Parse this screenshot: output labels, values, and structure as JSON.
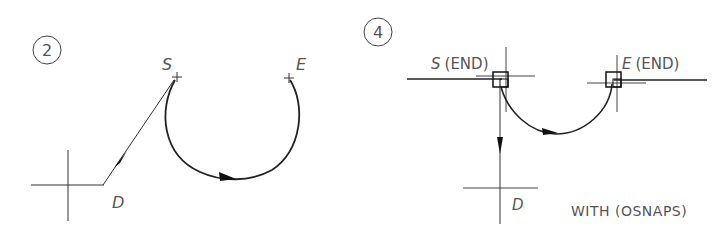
{
  "colors": {
    "background": "#ffffff",
    "line": "#222222",
    "thin_line": "#444444",
    "text": "#555555"
  },
  "panels": [
    {
      "id": "panel-2",
      "step_number": "2",
      "labels": {
        "start": "S",
        "end": "E",
        "direction": "D"
      }
    },
    {
      "id": "panel-4",
      "step_number": "4",
      "labels": {
        "start": "S",
        "start_snap": "(END)",
        "end": "E",
        "end_snap": "(END)",
        "direction": "D",
        "caption": "WITH (OSNAPS)"
      }
    }
  ]
}
